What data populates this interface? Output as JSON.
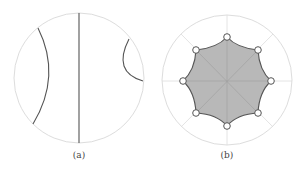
{
  "figure": {
    "panels": [
      {
        "id": "a",
        "caption": "(a)",
        "description": "Poincaré disk with three geodesics: a diameter and two circular arcs",
        "disk": {
          "cx": 79,
          "cy": 78,
          "r": 65,
          "stroke": "#dddddd"
        },
        "geodesics": [
          {
            "type": "arc",
            "d": "M 38 28 Q 62 76 33 124"
          },
          {
            "type": "line",
            "d": "M 79 13 L 79 143"
          },
          {
            "type": "arc",
            "d": "M 129 39 Q 112 72 143 81"
          }
        ],
        "line_color": "#555555"
      },
      {
        "id": "b",
        "caption": "(b)",
        "description": "Poincaré disk with a regular hyperbolic octagon with ideal-like vertices marked",
        "disk": {
          "cx": 227,
          "cy": 80,
          "r": 65,
          "stroke": "#dddddd"
        },
        "octagon_vertices": [
          [
            227,
            37
          ],
          [
            258,
            50
          ],
          [
            271,
            81
          ],
          [
            258,
            113
          ],
          [
            227,
            126
          ],
          [
            196,
            113
          ],
          [
            183,
            81
          ],
          [
            196,
            50
          ]
        ],
        "fill": "#b8b8b8",
        "edge_color": "#555555",
        "vertex_marker": "open-circle"
      }
    ]
  }
}
